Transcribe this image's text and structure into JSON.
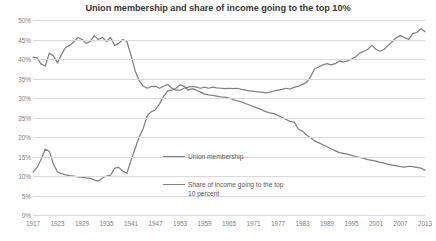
{
  "chart_data": {
    "type": "line",
    "title": "Union membership and share of income going to the top 10%",
    "xlabel": "",
    "ylabel": "",
    "grid": true,
    "legend_position": "center",
    "xlim": [
      1917,
      2013
    ],
    "ylim": [
      0,
      50
    ],
    "ytick_labels": [
      "50%",
      "45%",
      "40%",
      "35%",
      "30%",
      "25%",
      "20%",
      "15%",
      "10%",
      "5%",
      "0%"
    ],
    "ytick_values": [
      50,
      45,
      40,
      35,
      30,
      25,
      20,
      15,
      10,
      5,
      0
    ],
    "xtick_labels": [
      "1917",
      "1923",
      "1929",
      "1935",
      "1941",
      "1947",
      "1953",
      "1959",
      "1965",
      "1971",
      "1977",
      "1983",
      "1989",
      "1995",
      "2001",
      "2007",
      "2013"
    ],
    "xtick_values": [
      1917,
      1923,
      1929,
      1935,
      1941,
      1947,
      1953,
      1959,
      1965,
      1971,
      1977,
      1983,
      1989,
      1995,
      2001,
      2007,
      2013
    ],
    "line_color": "#808080",
    "gridline_color": "#d9d9d9",
    "x": [
      1917,
      1918,
      1919,
      1920,
      1921,
      1922,
      1923,
      1924,
      1925,
      1926,
      1927,
      1928,
      1929,
      1930,
      1931,
      1932,
      1933,
      1934,
      1935,
      1936,
      1937,
      1938,
      1939,
      1940,
      1941,
      1942,
      1943,
      1944,
      1945,
      1946,
      1947,
      1948,
      1949,
      1950,
      1951,
      1952,
      1953,
      1954,
      1955,
      1956,
      1957,
      1958,
      1959,
      1960,
      1961,
      1962,
      1963,
      1964,
      1965,
      1966,
      1967,
      1968,
      1969,
      1970,
      1971,
      1972,
      1973,
      1974,
      1975,
      1976,
      1977,
      1978,
      1979,
      1980,
      1981,
      1982,
      1983,
      1984,
      1985,
      1986,
      1987,
      1988,
      1989,
      1990,
      1991,
      1992,
      1993,
      1994,
      1995,
      1996,
      1997,
      1998,
      1999,
      2000,
      2001,
      2002,
      2003,
      2004,
      2005,
      2006,
      2007,
      2008,
      2009,
      2010,
      2011,
      2012,
      2013
    ],
    "series": [
      {
        "name": "Union membership",
        "values": [
          11.0,
          12.2,
          14.3,
          16.9,
          16.3,
          13.0,
          11.1,
          10.6,
          10.3,
          10.1,
          10.0,
          9.8,
          9.7,
          9.5,
          9.4,
          9.0,
          8.7,
          9.5,
          10.0,
          10.2,
          12.0,
          12.2,
          11.2,
          10.7,
          14.0,
          17.0,
          20.0,
          22.2,
          25.5,
          26.5,
          27.0,
          28.5,
          30.5,
          31.8,
          32.0,
          32.5,
          33.4,
          33.0,
          32.0,
          32.4,
          32.0,
          31.5,
          31.0,
          30.8,
          30.7,
          30.5,
          30.3,
          30.2,
          30.0,
          29.6,
          29.3,
          29.0,
          28.6,
          28.2,
          27.8,
          27.4,
          27.0,
          26.5,
          26.2,
          26.0,
          25.5,
          25.0,
          24.5,
          24.0,
          23.8,
          22.0,
          21.5,
          20.5,
          19.8,
          19.0,
          18.5,
          18.0,
          17.5,
          17.0,
          16.5,
          16.0,
          15.8,
          15.6,
          15.3,
          15.0,
          14.8,
          14.5,
          14.2,
          14.0,
          13.8,
          13.5,
          13.3,
          13.0,
          12.8,
          12.6,
          12.4,
          12.3,
          12.5,
          12.4,
          12.2,
          12.0,
          11.5
        ]
      },
      {
        "name": "Share of income going to the top 10 percent",
        "values": [
          40.5,
          40.3,
          38.7,
          38.2,
          41.5,
          40.8,
          39.0,
          41.2,
          43.0,
          43.5,
          44.4,
          45.5,
          45.0,
          44.0,
          44.5,
          46.0,
          45.0,
          45.5,
          44.5,
          45.5,
          43.5,
          44.0,
          45.0,
          44.5,
          41.0,
          37.0,
          34.5,
          33.0,
          32.5,
          33.0,
          33.0,
          32.5,
          33.0,
          33.5,
          32.5,
          32.0,
          32.0,
          32.5,
          32.8,
          33.0,
          32.8,
          32.5,
          32.8,
          32.5,
          32.8,
          32.6,
          32.5,
          32.4,
          32.5,
          32.4,
          32.5,
          32.2,
          32.0,
          31.8,
          31.7,
          31.6,
          31.5,
          31.3,
          31.5,
          31.8,
          32.0,
          32.2,
          32.5,
          32.3,
          32.8,
          33.0,
          33.5,
          34.0,
          35.5,
          37.5,
          38.0,
          38.5,
          38.8,
          38.5,
          38.8,
          39.5,
          39.2,
          39.5,
          40.0,
          40.5,
          41.5,
          42.0,
          42.5,
          43.5,
          42.5,
          42.0,
          42.5,
          43.5,
          44.5,
          45.5,
          46.0,
          45.5,
          45.0,
          46.5,
          46.8,
          47.8,
          47.0
        ]
      }
    ]
  },
  "legend": {
    "union_label": "Union membership",
    "income_label": "Share of income going to the top 10 percent"
  }
}
